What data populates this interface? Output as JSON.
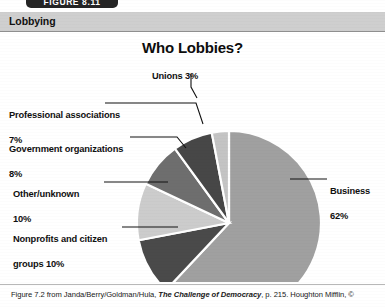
{
  "figure_tab": {
    "label": "FIGURE 8.11"
  },
  "header": {
    "title": "Lobbying"
  },
  "caption": {
    "pre": "Figure 7.2 from Janda/Berry/Goldman/Hula, ",
    "italic": "The Challenge of Democracy",
    "post": ", p. 215. Houghton Mifflin, ©"
  },
  "chart_data": {
    "type": "pie",
    "title": "Who Lobbies?",
    "xlabel": "",
    "ylabel": "",
    "legend_position": "callout-labels",
    "grid": false,
    "start_angle_deg": 0,
    "direction": "clockwise",
    "categories": [
      "Business",
      "Nonprofits and citizen groups",
      "Other/unknown",
      "Government organizations",
      "Professional associations",
      "Unions"
    ],
    "values": [
      62,
      10,
      10,
      8,
      7,
      3
    ],
    "units": "percent",
    "slices": [
      {
        "name": "Business",
        "value": 62,
        "value_label": "62%",
        "color": "#a0a0a0",
        "label_line1": "Business",
        "label_line2": "62%"
      },
      {
        "name": "Nonprofits and citizen groups",
        "value": 10,
        "value_label": "10%",
        "color": "#4a4a4a",
        "label_line1": "Nonprofits and citizen",
        "label_line2": "groups  10%"
      },
      {
        "name": "Other/unknown",
        "value": 10,
        "value_label": "10%",
        "color": "#cccccc",
        "label_line1": "Other/unknown",
        "label_line2": "10%"
      },
      {
        "name": "Government organizations",
        "value": 8,
        "value_label": "8%",
        "color": "#6e6e6e",
        "label_line1": "Government organizations",
        "label_line2": "8%"
      },
      {
        "name": "Professional associations",
        "value": 7,
        "value_label": "7%",
        "color": "#474747",
        "label_line1": "Professional associations",
        "label_line2": "7%"
      },
      {
        "name": "Unions",
        "value": 3,
        "value_label": "3%",
        "color": "#c4c4c4",
        "label_line1": "Unions  3%",
        "label_line2": ""
      }
    ]
  }
}
